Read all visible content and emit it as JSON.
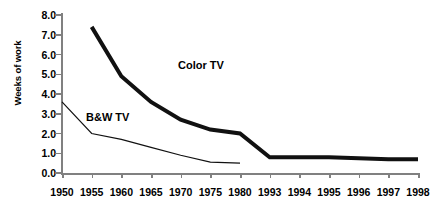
{
  "chart_data": {
    "type": "line",
    "title": "",
    "subtitle": "",
    "xlabel": "",
    "ylabel": "Weeks of work",
    "categories": [
      "1950",
      "1955",
      "1960",
      "1965",
      "1970",
      "1975",
      "1980",
      "1993",
      "1994",
      "1995",
      "1996",
      "1997",
      "1998"
    ],
    "ylim": [
      0.0,
      8.0
    ],
    "ytick_labels": [
      "0.0",
      "1.0",
      "2.0",
      "3.0",
      "4.0",
      "5.0",
      "6.0",
      "7.0",
      "8.0"
    ],
    "ytick_values": [
      0.0,
      1.0,
      2.0,
      3.0,
      4.0,
      5.0,
      6.0,
      7.0,
      8.0
    ],
    "grid": false,
    "legend_position": "inline-annotation",
    "series": [
      {
        "name": "Color TV",
        "annotation": "Color TV",
        "color": "#111111",
        "line_width": 4,
        "x": [
          "1955",
          "1960",
          "1965",
          "1970",
          "1975",
          "1980",
          "1993",
          "1994",
          "1995",
          "1996",
          "1997",
          "1998"
        ],
        "values": [
          7.4,
          4.9,
          3.6,
          2.7,
          2.2,
          2.0,
          0.8,
          0.8,
          0.8,
          0.75,
          0.7,
          0.7
        ]
      },
      {
        "name": "B&W TV",
        "annotation": "B&W TV",
        "color": "#111111",
        "line_width": 1.2,
        "x": [
          "1950",
          "1955",
          "1960",
          "1965",
          "1970",
          "1975",
          "1980"
        ],
        "values": [
          3.6,
          2.0,
          1.7,
          1.3,
          0.9,
          0.55,
          0.5
        ]
      }
    ]
  },
  "axis": {
    "axis_color": "#808080",
    "tick_color": "#808080"
  }
}
